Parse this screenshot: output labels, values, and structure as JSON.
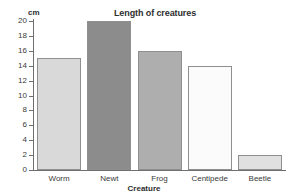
{
  "chart_data": {
    "type": "bar",
    "title": "Length of creatures",
    "xlabel": "Creature",
    "ylabel": "cm",
    "categories": [
      "Worm",
      "Newt",
      "Frog",
      "Centipede",
      "Beetle"
    ],
    "values": [
      15,
      20,
      16,
      14,
      2
    ],
    "ylim": [
      0,
      20
    ],
    "ytick_step": 2,
    "yticks": [
      0,
      2,
      4,
      6,
      8,
      10,
      12,
      14,
      16,
      18,
      20
    ],
    "ytick_labels": [
      "0",
      "2",
      "4",
      "6",
      "8",
      "10",
      "12",
      "14",
      "16",
      "18",
      "20"
    ],
    "grid": false,
    "legend": false,
    "bar_colors": [
      "#d9d9d9",
      "#8c8c8c",
      "#aeaeae",
      "#fbfbfb",
      "#e0e0e0"
    ],
    "bar_edge_color": "#8f8f8f",
    "axis_color": "#6f6f6f",
    "background": "#ffffff",
    "bars": [
      {
        "category": "Worm",
        "value": 15,
        "color": "#d9d9d9",
        "hatched": false
      },
      {
        "category": "Newt",
        "value": 20,
        "color": "#8c8c8c",
        "hatched": false
      },
      {
        "category": "Frog",
        "value": 16,
        "color": "#aeaeae",
        "hatched": true
      },
      {
        "category": "Centipede",
        "value": 14,
        "color": "#fbfbfb",
        "hatched": false
      },
      {
        "category": "Beetle",
        "value": 2,
        "color": "#e0e0e0",
        "hatched": false
      }
    ]
  }
}
